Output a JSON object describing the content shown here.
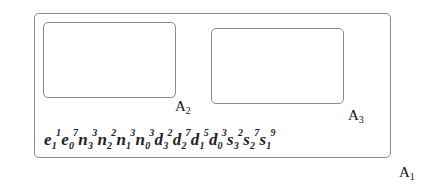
{
  "diagram": {
    "type": "nested-regions",
    "colors": {
      "border": "#8a8a8a",
      "text": "#111111",
      "background": "#ffffff"
    },
    "regions": [
      {
        "id": "A1",
        "label_base": "A",
        "label_sub": "1",
        "contains": [
          "A2",
          "A3"
        ]
      },
      {
        "id": "A2",
        "label_base": "A",
        "label_sub": "2",
        "contains": []
      },
      {
        "id": "A3",
        "label_base": "A",
        "label_sub": "3",
        "contains": []
      }
    ],
    "labels": {
      "a1": {
        "base": "A",
        "sub": "1"
      },
      "a2": {
        "base": "A",
        "sub": "2"
      },
      "a3": {
        "base": "A",
        "sub": "3"
      }
    },
    "formula": {
      "terms": [
        {
          "base": "e",
          "sub": "1",
          "sup": "1"
        },
        {
          "base": "e",
          "sub": "0",
          "sup": "7"
        },
        {
          "base": "n",
          "sub": "3",
          "sup": "3"
        },
        {
          "base": "n",
          "sub": "2",
          "sup": "2"
        },
        {
          "base": "n",
          "sub": "1",
          "sup": "3"
        },
        {
          "base": "n",
          "sub": "0",
          "sup": "3"
        },
        {
          "base": "d",
          "sub": "3",
          "sup": "2"
        },
        {
          "base": "d",
          "sub": "2",
          "sup": "7"
        },
        {
          "base": "d",
          "sub": "1",
          "sup": "5"
        },
        {
          "base": "d",
          "sub": "0",
          "sup": "3"
        },
        {
          "base": "s",
          "sub": "3",
          "sup": "2"
        },
        {
          "base": "s",
          "sub": "2",
          "sup": "7"
        },
        {
          "base": "s",
          "sub": "1",
          "sup": "9"
        }
      ]
    }
  }
}
